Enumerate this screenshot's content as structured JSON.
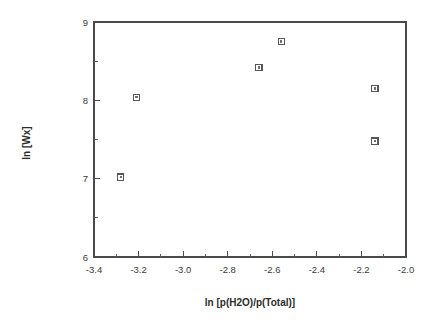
{
  "chart_data": {
    "type": "scatter",
    "title": "",
    "xlabel": "ln [p(H2O)/p(Total)]",
    "ylabel": "ln [Wx]",
    "xlim": [
      -3.4,
      -2.0
    ],
    "ylim": [
      6,
      9
    ],
    "grid": false,
    "legend": null,
    "marker_style": "open-square",
    "marker_color": "#565656",
    "x_major_ticks": [
      -3.4,
      -3.2,
      -3.0,
      -2.8,
      -2.6,
      -2.4,
      -2.2,
      -2.0
    ],
    "x_tick_labels": [
      "-3.4",
      "-3.2",
      "-3.0",
      "-2.8",
      "-2.6",
      "-2.4",
      "-2.2",
      "-2.0"
    ],
    "x_minor_ticks": [
      -3.3,
      -3.1,
      -2.9,
      -2.7,
      -2.5,
      -2.3,
      -2.1
    ],
    "y_major_ticks": [
      6,
      7,
      8,
      9
    ],
    "y_tick_labels": [
      "6",
      "7",
      "8",
      "9"
    ],
    "y_minor_ticks": [
      6.5,
      7.5,
      8.5
    ],
    "series": [
      {
        "name": "data",
        "points": [
          {
            "x": -3.28,
            "y": 7.02
          },
          {
            "x": -3.21,
            "y": 8.04
          },
          {
            "x": -2.66,
            "y": 8.42
          },
          {
            "x": -2.56,
            "y": 8.75
          },
          {
            "x": -2.14,
            "y": 8.15
          },
          {
            "x": -2.14,
            "y": 7.48
          }
        ]
      }
    ]
  },
  "figure": {
    "background": "#ffffff",
    "axis_color": "#4a4a4a"
  }
}
